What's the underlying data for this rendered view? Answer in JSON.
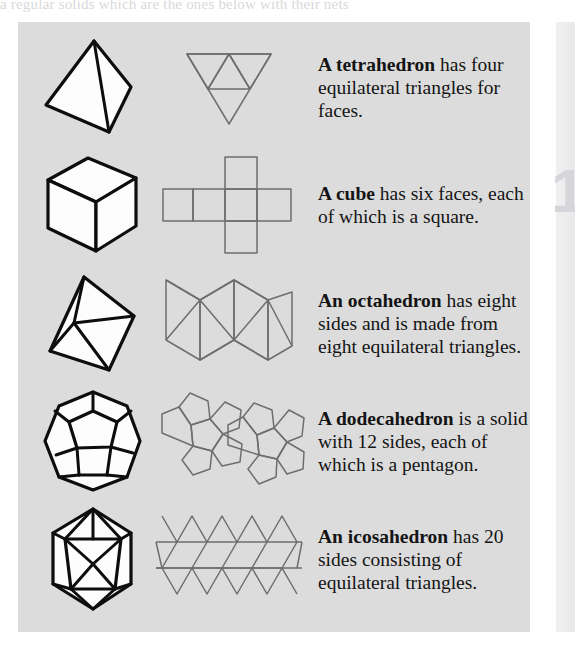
{
  "page": {
    "header_faint_text": "a regular solids which are the ones below with their nets",
    "page_number": "1"
  },
  "panel": {
    "background_color": "#dcdcdc",
    "rows": [
      {
        "solid_name": "tetrahedron",
        "shape_3d": "tetrahedron-3d",
        "net": "tetrahedron-net",
        "lead": "A tetrahedron",
        "body": " has four equilateral triangles for faces.",
        "faces": 4,
        "face_shape": "equilateral triangle"
      },
      {
        "solid_name": "cube",
        "shape_3d": "cube-3d",
        "net": "cube-net",
        "lead": "A cube",
        "body": " has six faces, each of which is a square.",
        "faces": 6,
        "face_shape": "square"
      },
      {
        "solid_name": "octahedron",
        "shape_3d": "octahedron-3d",
        "net": "octahedron-net",
        "lead": "An octahedron",
        "body": " has eight sides and is made from eight equilateral triangles.",
        "faces": 8,
        "face_shape": "equilateral triangle"
      },
      {
        "solid_name": "dodecahedron",
        "shape_3d": "dodecahedron-3d",
        "net": "dodecahedron-net",
        "lead": "A dodecahedron",
        "body": " is a solid with 12 sides, each of which is a pentagon.",
        "faces": 12,
        "face_shape": "pentagon"
      },
      {
        "solid_name": "icosahedron",
        "shape_3d": "icosahedron-3d",
        "net": "icosahedron-net",
        "lead": "An icosahedron",
        "body": " has 20 sides consisting of equilateral triangles.",
        "faces": 20,
        "face_shape": "equilateral triangle"
      }
    ]
  },
  "colors": {
    "panel_background": "#dcdcdc",
    "page_background": "#ffffff",
    "solid_outline": "#0d0d0d",
    "net_outline": "#6e6e6e",
    "text": "#141414",
    "page_number": "#d6d6da"
  }
}
